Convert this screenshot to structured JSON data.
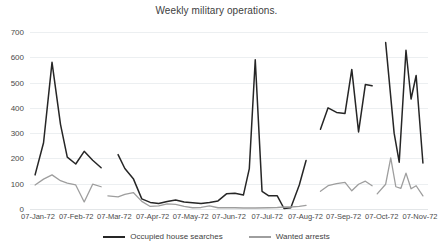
{
  "chart_data": {
    "type": "line",
    "title": "Weekly military operations.",
    "xlabel": "",
    "ylabel": "",
    "ylim": [
      0,
      700
    ],
    "yticks": [
      0,
      100,
      200,
      300,
      400,
      500,
      600,
      700
    ],
    "grid": true,
    "legend_position": "bottom",
    "xticks": [
      "07-Jan-72",
      "07-Feb-72",
      "07-Mar-72",
      "07-Apr-72",
      "07-May-72",
      "07-Jun-72",
      "07-Jul-72",
      "07-Aug-72",
      "07-Sep-72",
      "07-Oct-72",
      "07-Nov-72"
    ],
    "xlim_weeks": [
      0,
      47
    ],
    "series": [
      {
        "name": "Occupied house searches",
        "color": "#262626",
        "points": [
          {
            "x": 0.6,
            "y": 135
          },
          {
            "x": 1.6,
            "y": 262
          },
          {
            "x": 2.6,
            "y": 580
          },
          {
            "x": 3.6,
            "y": 335
          },
          {
            "x": 4.4,
            "y": 205
          },
          {
            "x": 5.4,
            "y": 178
          },
          {
            "x": 6.4,
            "y": 228
          },
          {
            "x": 7.4,
            "y": 193
          },
          {
            "x": 8.4,
            "y": 163
          },
          {
            "x": 10.4,
            "y": 215
          },
          {
            "x": 11.2,
            "y": 160
          },
          {
            "x": 12.2,
            "y": 120
          },
          {
            "x": 13.2,
            "y": 40
          },
          {
            "x": 14.2,
            "y": 26
          },
          {
            "x": 15.2,
            "y": 22
          },
          {
            "x": 16.2,
            "y": 30
          },
          {
            "x": 17.2,
            "y": 36
          },
          {
            "x": 18.2,
            "y": 28
          },
          {
            "x": 19.2,
            "y": 25
          },
          {
            "x": 20.2,
            "y": 22
          },
          {
            "x": 21.2,
            "y": 26
          },
          {
            "x": 22.2,
            "y": 32
          },
          {
            "x": 23.2,
            "y": 60
          },
          {
            "x": 24.2,
            "y": 62
          },
          {
            "x": 25.2,
            "y": 55
          },
          {
            "x": 25.9,
            "y": 160
          },
          {
            "x": 26.6,
            "y": 590
          },
          {
            "x": 27.4,
            "y": 70
          },
          {
            "x": 28.2,
            "y": 52
          },
          {
            "x": 29.2,
            "y": 52
          },
          {
            "x": 30.0,
            "y": 2
          },
          {
            "x": 30.8,
            "y": 5
          },
          {
            "x": 31.8,
            "y": 95
          },
          {
            "x": 32.6,
            "y": 192
          },
          {
            "x": 34.3,
            "y": 315
          },
          {
            "x": 35.2,
            "y": 400
          },
          {
            "x": 36.2,
            "y": 382
          },
          {
            "x": 37.2,
            "y": 378
          },
          {
            "x": 38.0,
            "y": 552
          },
          {
            "x": 38.8,
            "y": 305
          },
          {
            "x": 39.6,
            "y": 492
          },
          {
            "x": 40.4,
            "y": 487
          },
          {
            "x": 42.0,
            "y": 658
          },
          {
            "x": 43.0,
            "y": 300
          },
          {
            "x": 43.6,
            "y": 185
          },
          {
            "x": 44.4,
            "y": 628
          },
          {
            "x": 45.0,
            "y": 435
          },
          {
            "x": 45.6,
            "y": 528
          },
          {
            "x": 46.4,
            "y": 182
          }
        ]
      },
      {
        "name": "Wanted arrests",
        "color": "#9e9e9e",
        "points": [
          {
            "x": 0.6,
            "y": 95
          },
          {
            "x": 1.6,
            "y": 118
          },
          {
            "x": 2.6,
            "y": 135
          },
          {
            "x": 3.6,
            "y": 112
          },
          {
            "x": 4.4,
            "y": 102
          },
          {
            "x": 5.4,
            "y": 95
          },
          {
            "x": 6.4,
            "y": 28
          },
          {
            "x": 7.4,
            "y": 98
          },
          {
            "x": 8.4,
            "y": 88
          },
          {
            "x": 9.2,
            "y": 52
          },
          {
            "x": 10.4,
            "y": 48
          },
          {
            "x": 11.2,
            "y": 58
          },
          {
            "x": 12.2,
            "y": 65
          },
          {
            "x": 13.2,
            "y": 30
          },
          {
            "x": 14.2,
            "y": 10
          },
          {
            "x": 15.2,
            "y": 12
          },
          {
            "x": 16.2,
            "y": 20
          },
          {
            "x": 17.2,
            "y": 18
          },
          {
            "x": 18.2,
            "y": 10
          },
          {
            "x": 19.2,
            "y": 5
          },
          {
            "x": 20.2,
            "y": 6
          },
          {
            "x": 21.2,
            "y": 12
          },
          {
            "x": 22.2,
            "y": 5
          },
          {
            "x": 23.2,
            "y": 5
          },
          {
            "x": 24.2,
            "y": 5
          },
          {
            "x": 25.2,
            "y": 4
          },
          {
            "x": 26.6,
            "y": 4
          },
          {
            "x": 28.2,
            "y": 5
          },
          {
            "x": 29.2,
            "y": 6
          },
          {
            "x": 30.0,
            "y": 8
          },
          {
            "x": 30.8,
            "y": 8
          },
          {
            "x": 31.8,
            "y": 10
          },
          {
            "x": 32.6,
            "y": 14
          },
          {
            "x": 34.3,
            "y": 70
          },
          {
            "x": 35.2,
            "y": 92
          },
          {
            "x": 36.2,
            "y": 100
          },
          {
            "x": 37.2,
            "y": 105
          },
          {
            "x": 38.0,
            "y": 72
          },
          {
            "x": 38.8,
            "y": 98
          },
          {
            "x": 39.6,
            "y": 110
          },
          {
            "x": 40.4,
            "y": 92
          },
          {
            "x": 41.0,
            "y": 60
          },
          {
            "x": 42.0,
            "y": 98
          },
          {
            "x": 42.6,
            "y": 202
          },
          {
            "x": 43.2,
            "y": 88
          },
          {
            "x": 43.8,
            "y": 82
          },
          {
            "x": 44.4,
            "y": 142
          },
          {
            "x": 45.0,
            "y": 80
          },
          {
            "x": 45.6,
            "y": 92
          },
          {
            "x": 46.4,
            "y": 52
          }
        ]
      }
    ],
    "gaps": {
      "note": "Line breaks between month clusters",
      "break_after_x": [
        8.4,
        32.6,
        40.4
      ]
    }
  },
  "legend": {
    "entries": [
      {
        "label": "Occupied house searches",
        "color": "#262626"
      },
      {
        "label": "Wanted arrests",
        "color": "#9e9e9e"
      }
    ]
  }
}
